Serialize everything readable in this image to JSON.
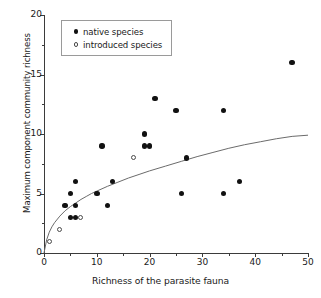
{
  "chart_data": {
    "type": "scatter",
    "title": "",
    "xlabel": "Richness of the parasite fauna",
    "ylabel": "Maximum component community richness",
    "xlim": [
      0,
      50
    ],
    "ylim": [
      0,
      20
    ],
    "xticks": [
      0,
      10,
      20,
      30,
      40,
      50
    ],
    "yticks": [
      0,
      5,
      10,
      15,
      20
    ],
    "xminor_ticks": [
      5,
      15,
      25,
      35,
      45
    ],
    "yminor_ticks": [
      2.5,
      7.5,
      12.5,
      17.5
    ],
    "grid": false,
    "legend_position": "top-left",
    "series": [
      {
        "name": "native species",
        "marker": "filled-circle",
        "color": "#111111",
        "points": [
          [
            4,
            4
          ],
          [
            5,
            5
          ],
          [
            5,
            3
          ],
          [
            6,
            6
          ],
          [
            6,
            3
          ],
          [
            6,
            4
          ],
          [
            10,
            5
          ],
          [
            11,
            9
          ],
          [
            12,
            4
          ],
          [
            13,
            6
          ],
          [
            19,
            9
          ],
          [
            19,
            10
          ],
          [
            20,
            9
          ],
          [
            21,
            13
          ],
          [
            25,
            12
          ],
          [
            26,
            5
          ],
          [
            27,
            8
          ],
          [
            34,
            5
          ],
          [
            34,
            12
          ],
          [
            37,
            6
          ],
          [
            47,
            16
          ]
        ]
      },
      {
        "name": "introduced species",
        "marker": "open-circle",
        "color": "#4a4a4a",
        "points": [
          [
            1,
            1
          ],
          [
            3,
            2
          ],
          [
            7,
            3
          ],
          [
            17,
            8
          ]
        ]
      }
    ],
    "fit_curve": {
      "description": "saturating logarithmic fit",
      "color": "#6b6b6b",
      "points": [
        [
          0,
          0
        ],
        [
          0.5,
          1.1
        ],
        [
          1,
          1.75
        ],
        [
          1.5,
          2.2
        ],
        [
          2,
          2.55
        ],
        [
          3,
          3.1
        ],
        [
          4,
          3.55
        ],
        [
          5,
          3.9
        ],
        [
          6,
          4.2
        ],
        [
          7,
          4.5
        ],
        [
          8,
          4.75
        ],
        [
          9,
          5.0
        ],
        [
          10,
          5.2
        ],
        [
          12,
          5.6
        ],
        [
          14,
          5.95
        ],
        [
          16,
          6.3
        ],
        [
          18,
          6.6
        ],
        [
          20,
          6.9
        ],
        [
          23,
          7.3
        ],
        [
          26,
          7.7
        ],
        [
          29,
          8.1
        ],
        [
          32,
          8.45
        ],
        [
          35,
          8.8
        ],
        [
          38,
          9.1
        ],
        [
          41,
          9.35
        ],
        [
          44,
          9.6
        ],
        [
          47,
          9.8
        ],
        [
          50,
          9.9
        ]
      ]
    }
  },
  "legend": {
    "items": [
      {
        "label": "native species",
        "marker": "filled-circle"
      },
      {
        "label": "introduced species",
        "marker": "open-circle"
      }
    ]
  },
  "axis_labels": {
    "x": "Richness of the parasite fauna",
    "y": "Maximum component community richness"
  }
}
